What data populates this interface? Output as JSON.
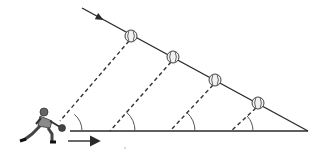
{
  "diagram": {
    "colors": {
      "background": "#ffffff",
      "line": "#2a2a2a",
      "dashed": "#333333",
      "arc": "#555555",
      "ball_fill": "#f2f2f2",
      "ball_stroke": "#444444"
    },
    "trajectory": {
      "x1": 82,
      "y1": 8,
      "x2": 308,
      "y2": 131,
      "arrow_at": [
        100,
        18
      ]
    },
    "baseline": {
      "x1": 70,
      "y1": 131,
      "x2": 308,
      "y2": 131
    },
    "motion_arrow": {
      "x1": 68,
      "y1": 141,
      "x2": 98,
      "y2": 141
    },
    "balls": [
      {
        "cx": 131,
        "cy": 36
      },
      {
        "cx": 173,
        "cy": 57
      },
      {
        "cx": 215,
        "cy": 80
      },
      {
        "cx": 258,
        "cy": 103
      }
    ],
    "sight_lines": [
      {
        "from": [
          129,
          41
        ],
        "to": [
          60,
          121
        ]
      },
      {
        "from": [
          171,
          62
        ],
        "to": [
          110,
          131
        ]
      },
      {
        "from": [
          213,
          85
        ],
        "to": [
          170,
          131
        ]
      },
      {
        "from": [
          256,
          108
        ],
        "to": [
          231,
          131
        ]
      }
    ],
    "angle_arcs": [
      {
        "cx": 60,
        "cy": 131,
        "r": 22
      },
      {
        "cx": 110,
        "cy": 131,
        "r": 25
      },
      {
        "cx": 170,
        "cy": 131,
        "r": 25
      },
      {
        "cx": 231,
        "cy": 131,
        "r": 22
      }
    ],
    "figure": {
      "label": "catcher",
      "x": 8,
      "y": 105
    }
  }
}
